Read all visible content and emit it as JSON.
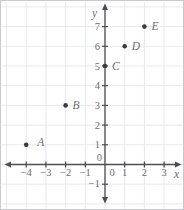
{
  "figure": {
    "kind": "coordinate-grid-scatter"
  },
  "chart_data": {
    "type": "scatter",
    "xlabel": "x",
    "ylabel": "y",
    "points": [
      {
        "label": "A",
        "x": -4,
        "y": 1
      },
      {
        "label": "B",
        "x": -2,
        "y": 3
      },
      {
        "label": "C",
        "x": 0,
        "y": 5
      },
      {
        "label": "D",
        "x": 1,
        "y": 6
      },
      {
        "label": "E",
        "x": 2,
        "y": 7
      }
    ],
    "x_tick_labels": [
      -4,
      -3,
      -2,
      -1,
      0,
      1,
      2,
      3
    ],
    "y_tick_labels": [
      -1,
      0,
      1,
      2,
      3,
      4,
      5,
      6,
      7
    ],
    "xlim": [
      -5,
      4
    ],
    "ylim": [
      -2,
      8
    ],
    "grid": true,
    "legend": false
  },
  "colors": {
    "background": "#ffffff",
    "frame_border": "#c9c9cd",
    "grid": "#e8e9ed",
    "axis": "#4d4d4f",
    "text": "#6e6e72",
    "point": "#3c3c3e"
  }
}
